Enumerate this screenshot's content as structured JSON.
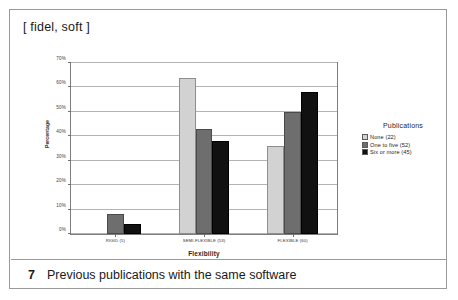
{
  "figure": {
    "header_label": "[ fidel, soft ]",
    "caption_number": "7",
    "caption_text": "Previous publications with the same software"
  },
  "legend": {
    "title": "Publications",
    "position": "right",
    "entries": [
      {
        "label": "None (22)",
        "color": "#d2d2d2"
      },
      {
        "label": "One to five (52)",
        "color": "#6e6e6e"
      },
      {
        "label": "Six or more (45)",
        "color": "#111111"
      }
    ]
  },
  "chart_data": {
    "type": "bar",
    "title": "",
    "xlabel": "Flexibility",
    "ylabel": "Percentage",
    "categories": [
      "RIGID (5)",
      "SEMI-FLEXIBLE (53)",
      "FLEXIBLE (60)"
    ],
    "series": [
      {
        "name": "None (22)",
        "color": "#d2d2d2",
        "values": [
          0,
          64,
          36
        ]
      },
      {
        "name": "One to five (52)",
        "color": "#6e6e6e",
        "values": [
          8,
          43,
          50
        ]
      },
      {
        "name": "Six or more (45)",
        "color": "#111111",
        "values": [
          4,
          38,
          58
        ]
      }
    ],
    "ylim": [
      0,
      70
    ],
    "ytick_values": [
      0,
      10,
      20,
      30,
      40,
      50,
      60,
      70
    ],
    "ytick_labels": [
      "0%",
      "10%",
      "20%",
      "30%",
      "40%",
      "50%",
      "60%",
      "70%"
    ],
    "grid": true,
    "grid_axis": "y"
  }
}
